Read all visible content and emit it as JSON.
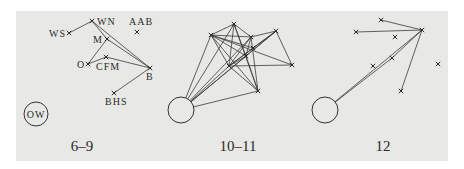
{
  "background": {
    "panel_color": "#e8e8e6",
    "x": 16,
    "y": 11,
    "width": 432,
    "height": 150
  },
  "panels": [
    {
      "caption": "6–9",
      "caption_pos": [
        82,
        151
      ],
      "circle": {
        "cx": 36,
        "cy": 114,
        "r": 12,
        "label": "OW"
      },
      "nodes": [
        {
          "id": "WS",
          "x": 69,
          "y": 33,
          "label": "WS",
          "lx": 49,
          "ly": 37,
          "anchor": "start"
        },
        {
          "id": "WN",
          "x": 92,
          "y": 21,
          "label": "WN",
          "lx": 97,
          "ly": 25,
          "anchor": "start"
        },
        {
          "id": "AAB",
          "x": 137,
          "y": 32,
          "label": "AAB",
          "lx": 129,
          "ly": 25,
          "anchor": "start"
        },
        {
          "id": "M",
          "x": 107,
          "y": 39,
          "label": "M",
          "lx": 93,
          "ly": 43,
          "anchor": "start"
        },
        {
          "id": "O",
          "x": 88,
          "y": 64,
          "label": "O",
          "lx": 77,
          "ly": 68,
          "anchor": "start"
        },
        {
          "id": "CFM",
          "x": 106,
          "y": 57,
          "label": "CFM",
          "lx": 96,
          "ly": 70,
          "anchor": "start"
        },
        {
          "id": "B",
          "x": 150,
          "y": 68,
          "label": "B",
          "lx": 146,
          "ly": 80,
          "anchor": "start"
        },
        {
          "id": "BHS",
          "x": 114,
          "y": 93,
          "label": "BHS",
          "lx": 105,
          "ly": 105,
          "anchor": "start"
        }
      ],
      "edges": [
        [
          "WS",
          "WN"
        ],
        [
          "WN",
          "B"
        ],
        [
          "WN",
          "M"
        ],
        [
          "M",
          "B"
        ],
        [
          "M",
          "O"
        ],
        [
          "O",
          "CFM"
        ],
        [
          "CFM",
          "B"
        ],
        [
          "B",
          "BHS"
        ]
      ],
      "circle_edges": []
    },
    {
      "caption": "10–11",
      "caption_pos": [
        238,
        151
      ],
      "circle": {
        "cx": 181,
        "cy": 110,
        "r": 13,
        "label": ""
      },
      "nodes": [
        {
          "id": "A",
          "x": 234,
          "y": 24
        },
        {
          "id": "B",
          "x": 211,
          "y": 35
        },
        {
          "id": "C",
          "x": 251,
          "y": 37
        },
        {
          "id": "D",
          "x": 276,
          "y": 31
        },
        {
          "id": "I",
          "x": 253,
          "y": 48
        },
        {
          "id": "E",
          "x": 246,
          "y": 56
        },
        {
          "id": "F",
          "x": 229,
          "y": 66
        },
        {
          "id": "G",
          "x": 292,
          "y": 65
        },
        {
          "id": "H",
          "x": 258,
          "y": 91
        }
      ],
      "edges": [
        [
          "A",
          "B"
        ],
        [
          "A",
          "C"
        ],
        [
          "A",
          "E"
        ],
        [
          "A",
          "F"
        ],
        [
          "A",
          "H"
        ],
        [
          "B",
          "C"
        ],
        [
          "B",
          "E"
        ],
        [
          "B",
          "F"
        ],
        [
          "B",
          "G"
        ],
        [
          "B",
          "H"
        ],
        [
          "B",
          "I"
        ],
        [
          "C",
          "D"
        ],
        [
          "C",
          "E"
        ],
        [
          "C",
          "F"
        ],
        [
          "C",
          "H"
        ],
        [
          "D",
          "E"
        ],
        [
          "D",
          "F"
        ],
        [
          "D",
          "G"
        ],
        [
          "D",
          "I"
        ],
        [
          "E",
          "F"
        ],
        [
          "E",
          "H"
        ],
        [
          "F",
          "G"
        ],
        [
          "F",
          "H"
        ],
        [
          "I",
          "F"
        ]
      ],
      "circle_edges": [
        "B",
        "A",
        "F",
        "E",
        "C",
        "D",
        "H"
      ]
    },
    {
      "caption": "12",
      "caption_pos": [
        383,
        151
      ],
      "circle": {
        "cx": 325,
        "cy": 110,
        "r": 13,
        "label": ""
      },
      "nodes": [
        {
          "id": "P1",
          "x": 381,
          "y": 20
        },
        {
          "id": "P2",
          "x": 356,
          "y": 32
        },
        {
          "id": "HUB",
          "x": 422,
          "y": 30
        },
        {
          "id": "P4",
          "x": 395,
          "y": 37
        },
        {
          "id": "P5",
          "x": 392,
          "y": 58
        },
        {
          "id": "P6",
          "x": 373,
          "y": 66
        },
        {
          "id": "P7",
          "x": 438,
          "y": 64
        },
        {
          "id": "P8",
          "x": 401,
          "y": 91
        }
      ],
      "edges": [
        [
          "P1",
          "HUB"
        ],
        [
          "P2",
          "HUB"
        ],
        [
          "HUB",
          "P8"
        ],
        [
          "HUB",
          "P5"
        ]
      ],
      "circle_edges": [
        "P5",
        "HUB"
      ]
    }
  ]
}
